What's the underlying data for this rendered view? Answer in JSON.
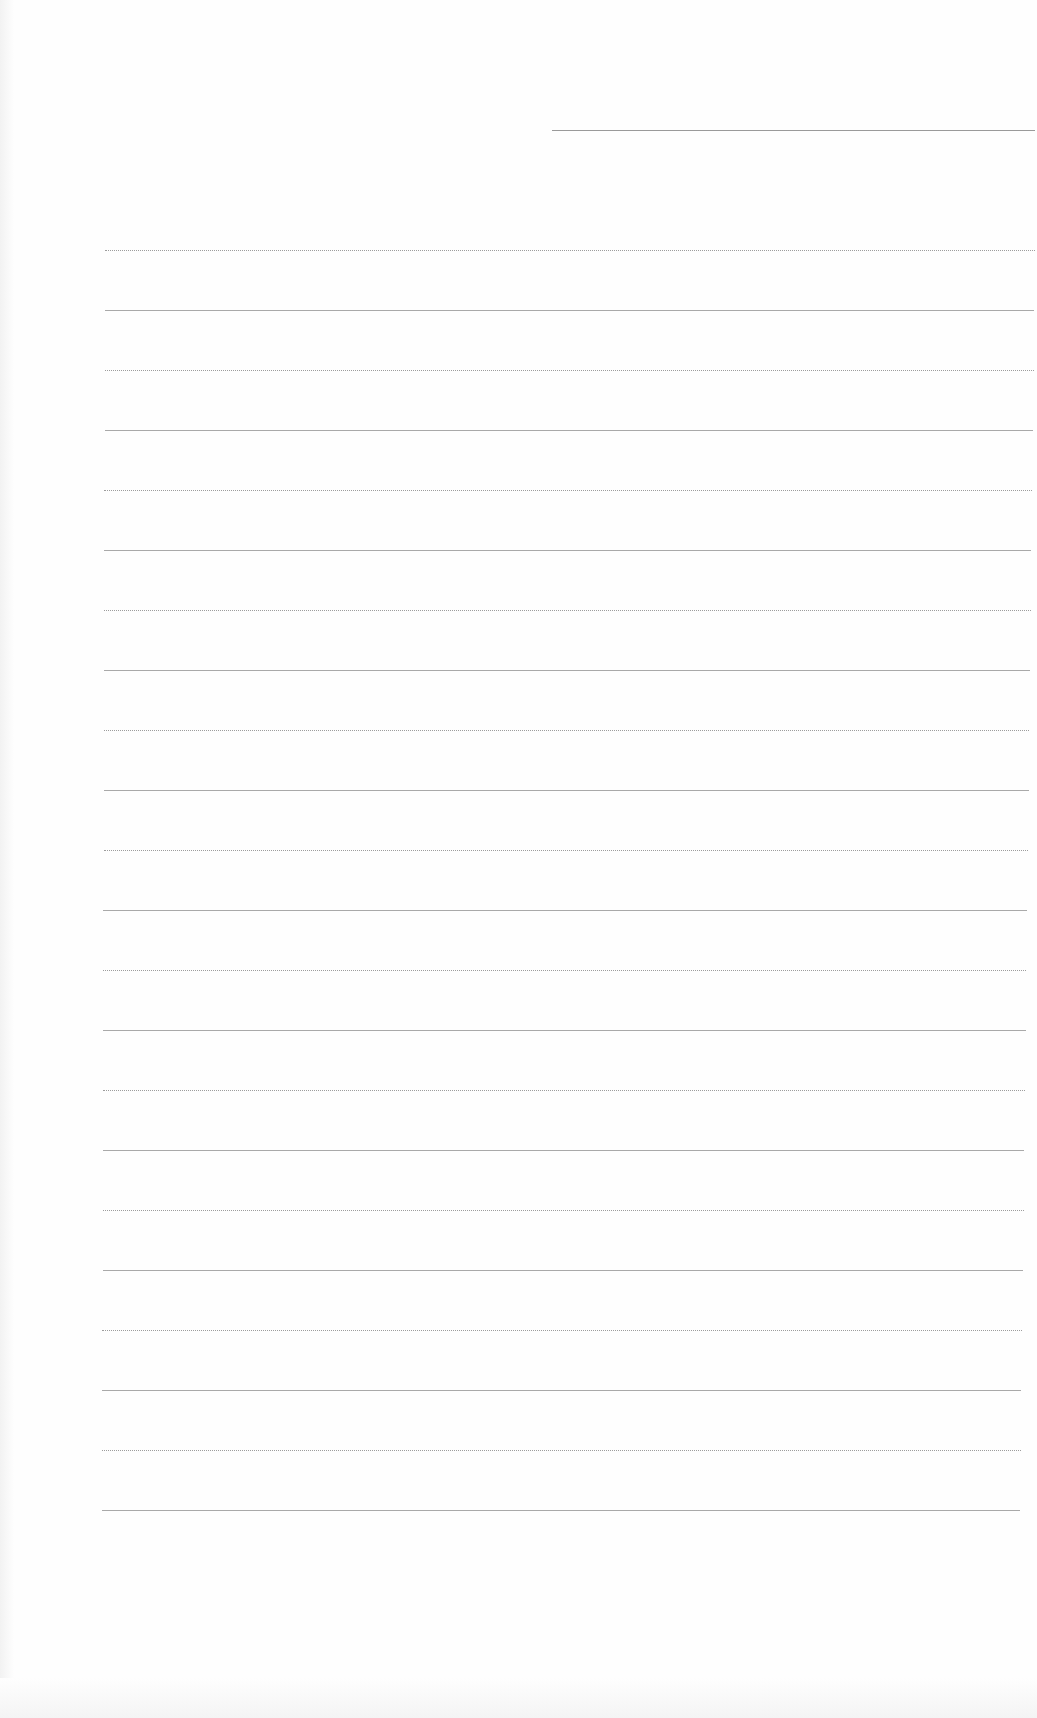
{
  "document": {
    "type": "blank lined sheet",
    "header_line": {
      "x": 552,
      "y": 130,
      "width": 483
    },
    "ruled_lines": {
      "count": 22,
      "start_y": 250,
      "spacing": 60,
      "left_x": 105
    },
    "colors": {
      "paper": "#fefefe",
      "line": "#9a9a9a"
    }
  }
}
